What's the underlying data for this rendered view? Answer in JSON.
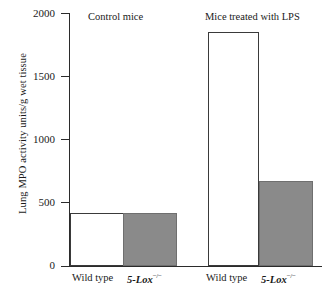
{
  "chart_data": {
    "type": "bar",
    "title": "",
    "xlabel": "",
    "ylabel": "Lung MPO activity units/g wet tissue",
    "ylim": [
      0,
      2000
    ],
    "yticks": [
      0,
      500,
      1000,
      1500,
      2000
    ],
    "ytick_labels": [
      "0",
      "500",
      "1000",
      "1500",
      "2000"
    ],
    "grid": false,
    "legend": "none",
    "groups": [
      {
        "name": "Control mice",
        "categories": [
          "Wild type",
          "5-Lox −/−"
        ],
        "values": [
          420,
          420
        ],
        "fills": [
          "white",
          "gray"
        ]
      },
      {
        "name": "Mice treated with LPS",
        "categories": [
          "Wild type",
          "5-Lox −/−"
        ],
        "values": [
          1850,
          675
        ],
        "fills": [
          "white",
          "gray"
        ]
      }
    ],
    "bars": [
      {
        "group": "Control mice",
        "category": "Wild type",
        "value": 420,
        "fill": "white"
      },
      {
        "group": "Control mice",
        "category": "5-Lox −/−",
        "value": 420,
        "fill": "gray"
      },
      {
        "group": "Mice treated with LPS",
        "category": "Wild type",
        "value": 1850,
        "fill": "white"
      },
      {
        "group": "Mice treated with LPS",
        "category": "5-Lox −/−",
        "value": 675,
        "fill": "gray"
      }
    ],
    "colors": {
      "wild_type_fill": "#ffffff",
      "knockout_fill": "#8a8a8a",
      "axis": "#2b2b2b",
      "background": "#ffffff"
    }
  },
  "axis": {
    "y_title": "Lung MPO activity units/g wet tissue",
    "ticks": [
      "2000",
      "1500",
      "1000",
      "500",
      "0"
    ]
  },
  "groups": {
    "control_title": "Control mice",
    "lps_title": "Mice treated with LPS"
  },
  "xlabels": {
    "wt": "Wild type",
    "ko_gene": "5-Lox",
    "ko_sup": "−/−"
  }
}
